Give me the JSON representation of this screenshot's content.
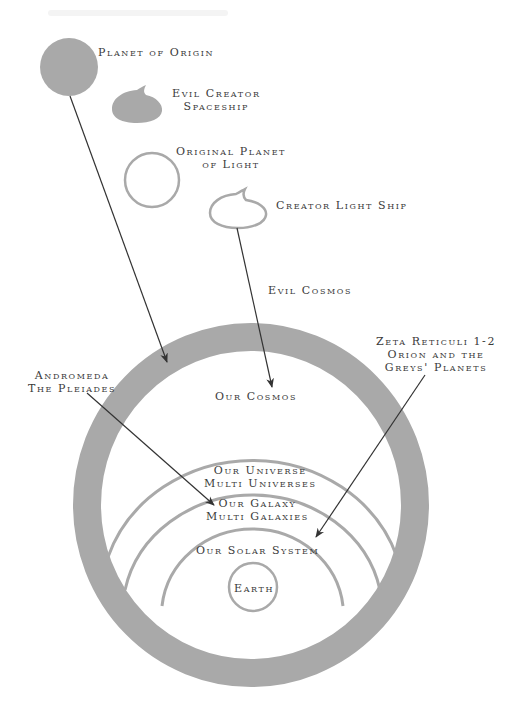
{
  "colors": {
    "shape_fill": "#a9a9a9",
    "line": "#333333",
    "text": "#3a3a3a",
    "background": "#ffffff"
  },
  "labels": {
    "planet_of_origin": "Planet of Origin",
    "evil_creator_spaceship": [
      "Evil Creator",
      "Spaceship"
    ],
    "original_planet_of_light": [
      "Original Planet",
      "of Light"
    ],
    "creator_light_ship": "Creator Light Ship",
    "evil_cosmos": "Evil Cosmos",
    "zeta_reticuli": [
      "Zeta Reticuli 1-2",
      "Orion and the",
      "Greys' Planets"
    ],
    "andromeda": [
      "Andromeda",
      "The Pleiades"
    ],
    "our_cosmos": "Our Cosmos",
    "our_universe": [
      "Our Universe",
      "Multi Universes"
    ],
    "our_galaxy": [
      "Our Galaxy",
      "Multi Galaxies"
    ],
    "our_solar_system": "Our Solar System",
    "earth": "Earth"
  }
}
